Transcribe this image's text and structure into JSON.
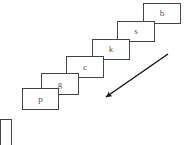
{
  "canvas": {
    "width": 191,
    "height": 145,
    "background": "#ffffff"
  },
  "diagram": {
    "type": "cascading-stacked-boxes-with-arrow",
    "stroke_color": "#444444",
    "text_color": "#555555",
    "arrow_color": "#111111",
    "nodes": [
      {
        "label": "b",
        "x": 143,
        "y": 3,
        "w": 38,
        "h": 21,
        "z": 1
      },
      {
        "label": "s",
        "x": 117,
        "y": 21,
        "w": 38,
        "h": 21,
        "z": 2
      },
      {
        "label": "k",
        "x": 92,
        "y": 39,
        "w": 38,
        "h": 21,
        "z": 3
      },
      {
        "label": "c",
        "x": 66,
        "y": 56,
        "w": 38,
        "h": 22,
        "z": 4
      },
      {
        "label": "g",
        "x": 41,
        "y": 73,
        "w": 38,
        "h": 22,
        "z": 5
      },
      {
        "label": "p",
        "x": 22,
        "y": 88,
        "w": 37,
        "h": 22,
        "z": 6
      }
    ],
    "partial_node": {
      "label": "",
      "x": 0,
      "y": 119,
      "w": 12,
      "h": 30
    },
    "arrow": {
      "x1": 168,
      "y1": 54,
      "x2": 103,
      "y2": 99,
      "head_size": 8,
      "direction": "down-left"
    }
  }
}
